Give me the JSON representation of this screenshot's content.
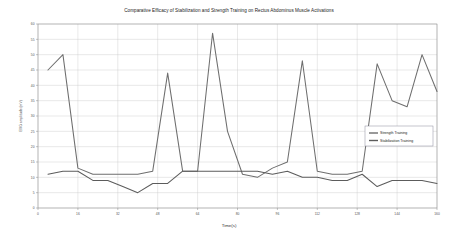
{
  "chart_data": {
    "type": "line",
    "title": "Comparative Efficacy of Stabilization and Strength Training on Rectus Abdominus Muscle Activations",
    "xlabel": "Time(s)",
    "ylabel": "EMG amplitude (mV)",
    "xlim": [
      0,
      160
    ],
    "ylim": [
      0,
      60
    ],
    "xticks": [
      0,
      16,
      32,
      48,
      64,
      80,
      96,
      112,
      128,
      144,
      160
    ],
    "xticklabels": [
      "0",
      "16",
      "32",
      "48",
      "64",
      "80",
      "96",
      "112",
      "128",
      "144",
      "160"
    ],
    "yticks": [
      0,
      5,
      10,
      15,
      20,
      25,
      30,
      35,
      40,
      45,
      50,
      55,
      60
    ],
    "yticklabels": [
      "0",
      "5",
      "10",
      "15",
      "20",
      "25",
      "30",
      "35",
      "40",
      "45",
      "50",
      "55",
      "60"
    ],
    "grid": true,
    "legend_position": "right",
    "x": [
      4,
      10,
      16,
      22,
      28,
      34,
      40,
      46,
      52,
      58,
      64,
      70,
      76,
      82,
      88,
      94,
      100,
      106,
      112,
      118,
      124,
      130,
      136,
      142,
      148,
      154,
      160
    ],
    "series": [
      {
        "name": "Strength Training",
        "color": "#6e6e6e",
        "values": [
          45,
          50,
          13,
          11,
          11,
          11,
          11,
          12,
          44,
          12,
          12,
          57,
          25,
          11,
          10,
          13,
          15,
          48,
          12,
          11,
          11,
          12,
          47,
          35,
          33,
          50,
          38
        ]
      },
      {
        "name": "Stabilization Training",
        "color": "#5c5c5c",
        "values": [
          11,
          12,
          12,
          9,
          9,
          7,
          5,
          8,
          8,
          12,
          12,
          12,
          12,
          12,
          12,
          11,
          12,
          10,
          10,
          9,
          9,
          11,
          7,
          9,
          9,
          9,
          8
        ]
      }
    ]
  },
  "legend": {
    "entries": [
      {
        "label": "Strength Training"
      },
      {
        "label": "Stabilization Training"
      }
    ]
  }
}
